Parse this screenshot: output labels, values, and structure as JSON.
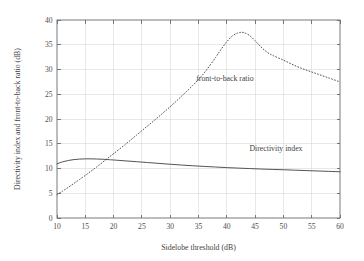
{
  "chart_data": {
    "type": "line",
    "title": "",
    "xlabel": "Sidelobe threshold (dB)",
    "ylabel": "Directivity index and front-to-back ratio (dB)",
    "xlim": [
      10,
      60
    ],
    "ylim": [
      0,
      40
    ],
    "grid": true,
    "legend_position": "inline-annotations",
    "xticks": [
      10,
      15,
      20,
      25,
      30,
      35,
      40,
      45,
      50,
      55,
      60
    ],
    "xtick_labels": [
      "10",
      "15",
      "20",
      "25",
      "30",
      "35",
      "40",
      "45",
      "50",
      "55",
      "60"
    ],
    "yticks": [
      0,
      5,
      10,
      15,
      20,
      25,
      30,
      35,
      40
    ],
    "ytick_labels": [
      "0",
      "5",
      "10",
      "15",
      "20",
      "25",
      "30",
      "35",
      "40"
    ],
    "series": [
      {
        "name": "Directivity index",
        "style": "solid",
        "color": "#4a4a4a",
        "annotation": "Directivity index",
        "annotation_x": 44.0,
        "annotation_y": 13.6,
        "x": [
          10,
          11,
          12,
          13,
          14,
          15,
          16,
          17,
          18,
          19,
          20,
          22,
          24,
          26,
          28,
          30,
          32,
          34,
          36,
          38,
          40,
          42,
          44,
          46,
          48,
          50,
          52,
          54,
          56,
          58,
          60
        ],
        "values": [
          10.95,
          11.35,
          11.62,
          11.8,
          11.9,
          11.95,
          11.95,
          11.92,
          11.87,
          11.8,
          11.72,
          11.55,
          11.38,
          11.2,
          11.03,
          10.86,
          10.7,
          10.55,
          10.42,
          10.3,
          10.18,
          10.08,
          9.99,
          9.9,
          9.82,
          9.75,
          9.66,
          9.58,
          9.5,
          9.42,
          9.34
        ]
      },
      {
        "name": "front-to-back ratio",
        "style": "dotted",
        "color": "#4a4a4a",
        "annotation": "front-to-back ratio",
        "annotation_x": 34.6,
        "annotation_y": 27.6,
        "x": [
          10,
          11,
          12,
          13,
          14,
          15,
          16,
          17,
          18,
          19,
          20,
          22,
          24,
          26,
          28,
          30,
          32,
          34,
          36,
          38,
          39,
          40,
          41,
          42,
          42.5,
          43,
          44,
          45,
          46,
          47,
          48,
          50,
          52,
          54,
          56,
          58,
          60
        ],
        "values": [
          4.7,
          5.45,
          6.2,
          7.0,
          7.8,
          8.6,
          9.45,
          10.3,
          11.2,
          12.1,
          13.0,
          14.8,
          16.7,
          18.6,
          20.5,
          22.5,
          24.6,
          26.8,
          29.3,
          32.4,
          34.1,
          35.6,
          36.8,
          37.4,
          37.5,
          37.45,
          36.9,
          35.8,
          34.6,
          33.6,
          32.9,
          31.9,
          30.8,
          29.9,
          29.1,
          28.3,
          27.5
        ]
      }
    ]
  }
}
